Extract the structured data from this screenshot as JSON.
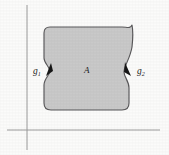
{
  "figure": {
    "background_color": "#fbfbfa",
    "region": {
      "label": "A",
      "fill_color": "#c9c9c9",
      "stroke_color": "#59585a"
    },
    "axes": {
      "color": "#9b9b9b",
      "vertical": {
        "x": 27,
        "y_top": 5,
        "y_bottom": 150
      },
      "horizontal": {
        "y": 130,
        "x_left": 7,
        "x_right": 160
      }
    },
    "markers": [
      {
        "name": "g1",
        "base": "g",
        "subscript": "1",
        "side": "left",
        "color": "#171717",
        "x": 50,
        "y": 72
      },
      {
        "name": "g2",
        "base": "g",
        "subscript": "2",
        "side": "right",
        "color": "#171717",
        "x": 130,
        "y": 72
      }
    ]
  }
}
